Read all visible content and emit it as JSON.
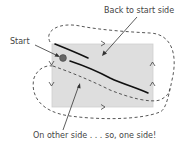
{
  "diagram": {
    "type": "one-sided-surface-path",
    "colors": {
      "background": "#ffffff",
      "surface_fill": "#dedede",
      "surface_stroke": "#c8c8c8",
      "path": "#111111",
      "dashed_loop": "#444444",
      "text": "#444444",
      "start_marker": "#555555"
    },
    "labels": {
      "back_to_start": "Back to start side",
      "start": "Start",
      "other_side": "On other side . . . so, one side!"
    },
    "direction_markers": [
      {
        "glyph": ">",
        "position": "top-edge"
      },
      {
        "glyph": ">",
        "position": "bottom-edge"
      },
      {
        "glyph": "v",
        "position": "left-edge-upper"
      },
      {
        "glyph": "v",
        "position": "left-edge-lower"
      },
      {
        "glyph": "^",
        "position": "right-edge-upper"
      },
      {
        "glyph": "^",
        "position": "right-edge-lower"
      }
    ]
  }
}
